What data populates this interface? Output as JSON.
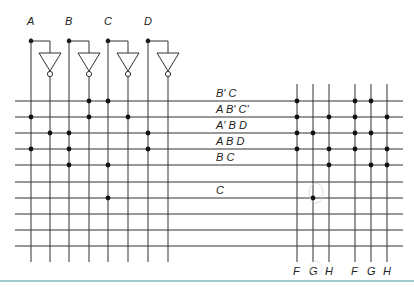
{
  "diagram": {
    "type": "PLA (programmable logic array)",
    "inputs": [
      {
        "label": "A",
        "x": 31,
        "inv_x": 50
      },
      {
        "label": "B",
        "x": 69,
        "inv_x": 89
      },
      {
        "label": "C",
        "x": 108,
        "inv_x": 128
      },
      {
        "label": "D",
        "x": 148,
        "inv_x": 168
      }
    ],
    "input_columns": [
      {
        "name": "A",
        "x": 31
      },
      {
        "name": "A'",
        "x": 50
      },
      {
        "name": "B",
        "x": 69
      },
      {
        "name": "B'",
        "x": 89
      },
      {
        "name": "C",
        "x": 108
      },
      {
        "name": "C'",
        "x": 128
      },
      {
        "name": "D",
        "x": 148
      },
      {
        "name": "D'",
        "x": 168
      }
    ],
    "output_columns": [
      {
        "label": "F",
        "x": 297
      },
      {
        "label": "G",
        "x": 313
      },
      {
        "label": "H",
        "x": 329
      },
      {
        "label": "F",
        "x": 355
      },
      {
        "label": "G",
        "x": 371
      },
      {
        "label": "H",
        "x": 387
      }
    ],
    "product_terms": [
      {
        "label": "B' C",
        "y": 101,
        "and_cols": [
          3,
          4
        ],
        "or_cols": [
          0,
          3,
          4
        ]
      },
      {
        "label": "A B' C'",
        "y": 117,
        "and_cols": [
          0,
          3,
          5
        ],
        "or_cols": [
          0,
          2,
          3,
          5
        ]
      },
      {
        "label": "A' B D",
        "y": 133,
        "and_cols": [
          1,
          2,
          6
        ],
        "or_cols": [
          0,
          1,
          3,
          4
        ]
      },
      {
        "label": "A B D",
        "y": 149,
        "and_cols": [
          0,
          2,
          6
        ],
        "or_cols": [
          0,
          2,
          3,
          5
        ]
      },
      {
        "label": "B C",
        "y": 165,
        "and_cols": [
          2,
          4
        ],
        "or_cols": [
          2,
          4,
          5
        ]
      },
      {
        "label": "",
        "y": 182,
        "and_cols": [],
        "or_cols": []
      },
      {
        "label": "C",
        "y": 198,
        "and_cols": [
          4
        ],
        "or_cols": [
          1
        ]
      },
      {
        "label": "",
        "y": 214,
        "and_cols": [],
        "or_cols": []
      },
      {
        "label": "",
        "y": 230,
        "and_cols": [],
        "or_cols": []
      },
      {
        "label": "",
        "y": 246,
        "and_cols": [],
        "or_cols": []
      }
    ],
    "colors": {
      "line": "#333333",
      "dot": "#111111",
      "rule": "#7fb8b8"
    }
  }
}
